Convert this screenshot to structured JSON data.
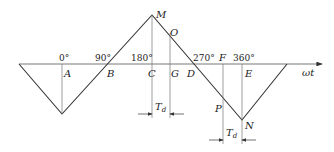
{
  "diagram": {
    "axis_label": "ωt",
    "degree_ticks": [
      {
        "label": "0°",
        "x": 59
      },
      {
        "label": "90°",
        "x": 95
      },
      {
        "label": "180°",
        "x": 131
      },
      {
        "label": "270°",
        "x": 193
      },
      {
        "label": "360°",
        "x": 233
      }
    ],
    "points": {
      "A": "A",
      "B": "B",
      "C": "C",
      "G": "G",
      "D": "D",
      "M": "M",
      "O": "O",
      "F": "F",
      "E": "E",
      "P": "P",
      "N": "N"
    },
    "delay_label_main": "T",
    "delay_label_sub": "d",
    "waveform_vertices": [
      [
        19,
        64
      ],
      [
        62,
        114
      ],
      [
        152,
        15
      ],
      [
        242,
        120
      ],
      [
        287,
        64
      ]
    ],
    "colors": {
      "line": "#333333",
      "guide": "#555555"
    }
  }
}
